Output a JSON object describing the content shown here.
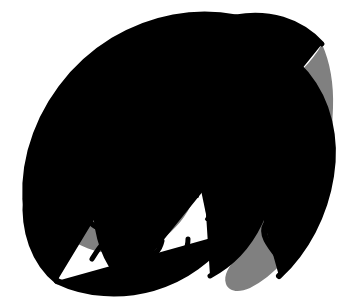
{
  "image": {
    "title": "Nautilus Shell Cross-Section",
    "subject": "nautilus-shell",
    "style": "black-and-white woodcut clipart",
    "alt_text": "Cross-section of a chambered nautilus shell showing a logarithmic spiral with radial chamber walls, a gray spiral band and a large gray aperture at lower right",
    "width_px": "341",
    "height_px": "304",
    "background_color": "#ffffff"
  },
  "palette": {
    "background": "#ffffff",
    "ink": "#000000",
    "gray_band": "#808080",
    "chamber_fill": "#ffffff"
  },
  "geometry": {
    "spiral_center_x": "137",
    "spiral_center_y": "160",
    "spiral_type": "logarithmic",
    "growth_factor": "1.28",
    "turns": "3.4",
    "winding_direction": "counter-clockwise",
    "septa_count": "34",
    "outline_stroke_px": "5"
  },
  "parts": [
    {
      "name": "outer-shell-outline",
      "label": "Outer shell outline",
      "color": "#000000",
      "description": "Thick black logarithmic spiral defining the shell's outer margin"
    },
    {
      "name": "gray-spiral-band",
      "label": "Gray spiral band",
      "color": "#808080",
      "description": "Mid-tone gray band following the spiral between chamber rows"
    },
    {
      "name": "chamber-septa",
      "label": "Chamber septa",
      "color": "#000000",
      "description": "Radial black dividing walls between successive gas chambers"
    },
    {
      "name": "shell-aperture",
      "label": "Shell aperture",
      "color": "#808080",
      "description": "Large solid gray living-chamber opening at the lower right"
    },
    {
      "name": "spiral-core",
      "label": "Spiral core",
      "color": "#000000",
      "description": "Tightly wound protoconch at the center of the spiral"
    }
  ],
  "bounds": {
    "left_px": "22",
    "right_px": "331",
    "top_px": "24",
    "bottom_px": "289"
  }
}
